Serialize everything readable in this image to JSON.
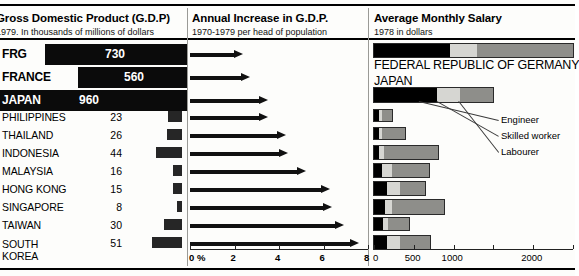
{
  "panels": {
    "gdp": {
      "title": "Gross Domestic Product (G.D.P)",
      "subtitle": "1979. In thousands of millions of dollars",
      "unit_note": "thousands of millions of dollars"
    },
    "increase": {
      "title": "Annual Increase in G.D.P.",
      "subtitle": "1970-1979 per head of population",
      "axis_labels": [
        "0 %",
        "2",
        "4",
        "6",
        "8"
      ],
      "axis_ticks": [
        0,
        2,
        4,
        6,
        8
      ]
    },
    "salary": {
      "title": "Average Monthly Salary",
      "subtitle": "1978 in dollars",
      "axis_labels": [
        "0",
        "500",
        "1000",
        "2000"
      ],
      "axis_ticks": [
        0,
        500,
        1000,
        1500,
        2000,
        2500
      ],
      "legend": [
        {
          "key": "engineer",
          "label": "Engineer"
        },
        {
          "key": "skilled",
          "label": "Skilled worker"
        },
        {
          "key": "labourer",
          "label": "Labourer"
        }
      ],
      "top_country_labels": [
        "FEDERAL REPUBLIC OF GERMANY",
        "JAPAN"
      ]
    }
  },
  "colors": {
    "ink": "#000000",
    "bar_dark": "#262626",
    "seg_engineer": "#000000",
    "seg_skilled": "#d6d6d2",
    "seg_labourer": "#8e8e8a",
    "paper": "#fdfdfb",
    "divider": "#9a9a96"
  },
  "rows": [
    {
      "country": "FRG",
      "featured": true,
      "gdp": 730,
      "gdp_text": "730",
      "increase_pct": 2.4,
      "salary_engineer": 950,
      "salary_skilled": 1300,
      "salary_labourer": 2500
    },
    {
      "country": "FRANCE",
      "featured": true,
      "gdp": 560,
      "gdp_text": "560",
      "increase_pct": 2.7,
      "salary_engineer": 0,
      "salary_skilled": 0,
      "salary_labourer": 0
    },
    {
      "country": "JAPAN",
      "featured": true,
      "gdp": 960,
      "gdp_text": "960",
      "increase_pct": 3.5,
      "salary_engineer": 790,
      "salary_skilled": 1075,
      "salary_labourer": 1500
    },
    {
      "country": "PHILIPPINES",
      "featured": false,
      "gdp": 23,
      "gdp_text": "23",
      "increase_pct": 3.5,
      "salary_engineer": 62,
      "salary_skilled": 100,
      "salary_labourer": 225
    },
    {
      "country": "THAILAND",
      "featured": false,
      "gdp": 26,
      "gdp_text": "26",
      "increase_pct": 4.3,
      "salary_engineer": 62,
      "salary_skilled": 100,
      "salary_labourer": 390
    },
    {
      "country": "INDONESIA",
      "featured": false,
      "gdp": 44,
      "gdp_text": "44",
      "increase_pct": 4.4,
      "salary_engineer": 62,
      "salary_skilled": 125,
      "salary_labourer": 800
    },
    {
      "country": "MALAYSIA",
      "featured": false,
      "gdp": 16,
      "gdp_text": "16",
      "increase_pct": 5.2,
      "salary_engineer": 100,
      "salary_skilled": 225,
      "salary_labourer": 690
    },
    {
      "country": "HONG KONG",
      "featured": false,
      "gdp": 15,
      "gdp_text": "15",
      "increase_pct": 6.3,
      "salary_engineer": 160,
      "salary_skilled": 330,
      "salary_labourer": 640
    },
    {
      "country": "SINGAPORE",
      "featured": false,
      "gdp": 8,
      "gdp_text": "8",
      "increase_pct": 6.4,
      "salary_engineer": 140,
      "salary_skilled": 220,
      "salary_labourer": 880
    },
    {
      "country": "TAIWAN",
      "featured": false,
      "gdp": 30,
      "gdp_text": "30",
      "increase_pct": 6.9,
      "salary_engineer": 110,
      "salary_skilled": 175,
      "salary_labourer": 440
    },
    {
      "country": "SOUTH KOREA",
      "featured": false,
      "gdp": 51,
      "gdp_text": "51",
      "increase_pct": 7.6,
      "salary_engineer": 160,
      "salary_skilled": 330,
      "salary_labourer": 700
    }
  ],
  "chart_data": {
    "type": "bar",
    "panels": [
      {
        "type": "bar",
        "title": "Gross Domestic Product (G.D.P)",
        "subtitle": "1979. In thousands of millions of dollars",
        "xlabel": "thousands of millions of dollars",
        "ylabel": "",
        "categories": [
          "FRG",
          "FRANCE",
          "JAPAN",
          "PHILIPPINES",
          "THAILAND",
          "INDONESIA",
          "MALAYSIA",
          "HONG KONG",
          "SINGAPORE",
          "TAIWAN",
          "SOUTH KOREA"
        ],
        "values": [
          730,
          560,
          960,
          23,
          26,
          44,
          16,
          15,
          8,
          30,
          51
        ],
        "grid": false,
        "legend": "none"
      },
      {
        "type": "bar",
        "title": "Annual Increase in G.D.P.",
        "subtitle": "1970-1979 per head of population",
        "xlabel": "%",
        "ylabel": "",
        "categories": [
          "FRG",
          "FRANCE",
          "JAPAN",
          "PHILIPPINES",
          "THAILAND",
          "INDONESIA",
          "MALAYSIA",
          "HONG KONG",
          "SINGAPORE",
          "TAIWAN",
          "SOUTH KOREA"
        ],
        "values": [
          2.4,
          2.7,
          3.5,
          3.5,
          4.3,
          4.4,
          5.2,
          6.3,
          6.4,
          6.9,
          7.6
        ],
        "xlim": [
          0,
          8
        ],
        "xticks": [
          0,
          2,
          4,
          6,
          8
        ],
        "grid": false,
        "legend": "none"
      },
      {
        "type": "bar",
        "title": "Average Monthly Salary",
        "subtitle": "1978 in dollars",
        "xlabel": "dollars",
        "ylabel": "",
        "stacked": true,
        "categories": [
          "FEDERAL REPUBLIC OF GERMANY",
          "JAPAN",
          "PHILIPPINES",
          "THAILAND",
          "INDONESIA",
          "MALAYSIA",
          "HONG KONG",
          "SINGAPORE",
          "TAIWAN",
          "SOUTH KOREA"
        ],
        "series": [
          {
            "name": "Engineer",
            "values": [
              950,
              790,
              62,
              62,
              62,
              100,
              160,
              140,
              110,
              160
            ]
          },
          {
            "name": "Skilled worker",
            "values": [
              1300,
              1075,
              100,
              100,
              125,
              225,
              330,
              220,
              175,
              330
            ]
          },
          {
            "name": "Labourer",
            "values": [
              2500,
              1500,
              225,
              390,
              800,
              690,
              640,
              880,
              440,
              700
            ]
          }
        ],
        "note": "Series values are cumulative segment end-points in dollars",
        "xlim": [
          0,
          2500
        ],
        "xticks": [
          0,
          500,
          1000,
          1500,
          2000,
          2500
        ],
        "xticklabels": [
          "0",
          "500",
          "1000",
          "",
          "2000",
          ""
        ],
        "grid": false,
        "legend": "inline-leader-lines"
      }
    ]
  }
}
